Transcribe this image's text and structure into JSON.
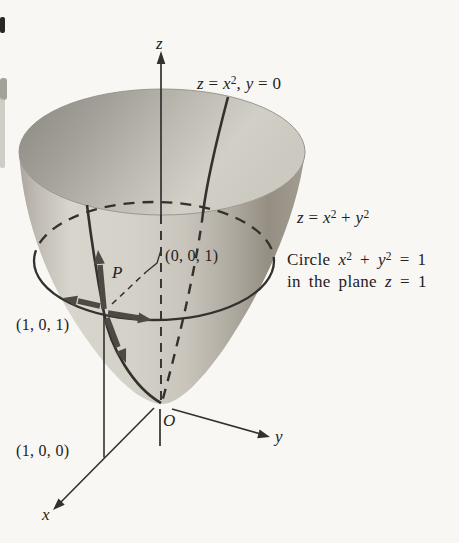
{
  "figure": {
    "kind": "math-diagram"
  },
  "labels": {
    "z_axis": [
      {
        "t": "z",
        "i": 1
      }
    ],
    "x_axis": [
      {
        "t": "x",
        "i": 1
      }
    ],
    "y_axis": [
      {
        "t": "y",
        "i": 1
      }
    ],
    "origin": [
      {
        "t": "O",
        "i": 1
      }
    ],
    "point_p": [
      {
        "t": "P",
        "i": 1
      }
    ],
    "point_001": [
      {
        "t": "(0, 0, 1)"
      }
    ],
    "point_101": [
      {
        "t": "(1, 0, 1)"
      }
    ],
    "point_100": [
      {
        "t": "(1, 0, 0)"
      }
    ],
    "parabola_eq": [
      {
        "t": "z",
        "i": 1
      },
      {
        "t": " = "
      },
      {
        "t": "x",
        "i": 1
      },
      {
        "t": "2",
        "s": 1
      },
      {
        "t": ", "
      },
      {
        "t": "y",
        "i": 1
      },
      {
        "t": " = 0"
      }
    ],
    "surface_eq": [
      {
        "t": "z",
        "i": 1
      },
      {
        "t": " = "
      },
      {
        "t": "x",
        "i": 1
      },
      {
        "t": "2",
        "s": 1
      },
      {
        "t": " + "
      },
      {
        "t": "y",
        "i": 1
      },
      {
        "t": "2",
        "s": 1
      }
    ],
    "circle_caption_line1": [
      {
        "t": "Circle "
      },
      {
        "t": "x",
        "i": 1
      },
      {
        "t": "2",
        "s": 1
      },
      {
        "t": " + "
      },
      {
        "t": "y",
        "i": 1
      },
      {
        "t": "2",
        "s": 1
      },
      {
        "t": " = 1"
      }
    ],
    "circle_caption_line2": [
      {
        "t": "in the plane "
      },
      {
        "t": "z",
        "i": 1
      },
      {
        "t": " = 1"
      }
    ]
  },
  "colors": {
    "background": "#f8f7f4",
    "line": "#33312e",
    "vector": "#4d4a43",
    "surface_light": "#d8d5cd",
    "surface_mid": "#c6c2b9",
    "surface_dark": "#8f897e",
    "inside_dark": "#8a8780",
    "inside_light": "#ccc9c1"
  }
}
